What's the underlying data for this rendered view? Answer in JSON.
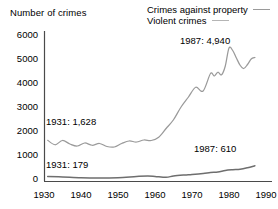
{
  "chart_data": {
    "type": "line",
    "title": "",
    "ylabel": "Number of crimes",
    "xlabel": "",
    "xlim": [
      1930,
      1990
    ],
    "ylim": [
      0,
      6000
    ],
    "grid": false,
    "legend_position": "top-right",
    "yticks": [
      "6000",
      "5000",
      "4000",
      "3000",
      "2000",
      "1000",
      "0"
    ],
    "ytick_values": [
      6000,
      5000,
      4000,
      3000,
      2000,
      1000,
      0
    ],
    "xticks": [
      "1930",
      "1940",
      "1950",
      "1960",
      "1970",
      "1980",
      "1990"
    ],
    "xtick_values": [
      1930,
      1940,
      1950,
      1960,
      1970,
      1980,
      1990
    ],
    "series": [
      {
        "name": "Crimes against property",
        "color": "#9a9a9a",
        "x": [
          1931,
          1933,
          1935,
          1937,
          1939,
          1941,
          1943,
          1945,
          1947,
          1949,
          1951,
          1953,
          1955,
          1957,
          1959,
          1961,
          1963,
          1965,
          1967,
          1969,
          1971,
          1973,
          1975,
          1976,
          1977,
          1978,
          1979,
          1980,
          1981,
          1982,
          1983,
          1984,
          1985,
          1986,
          1987
        ],
        "values": [
          1628,
          1450,
          1620,
          1480,
          1400,
          1520,
          1430,
          1500,
          1380,
          1360,
          1500,
          1600,
          1560,
          1640,
          1620,
          1750,
          2100,
          2450,
          2950,
          3350,
          3750,
          3600,
          4300,
          4200,
          4350,
          4250,
          4600,
          5320,
          5220,
          4920,
          4630,
          4500,
          4660,
          4880,
          4940
        ]
      },
      {
        "name": "Violent crimes",
        "color": "#6e6e6e",
        "x": [
          1931,
          1935,
          1940,
          1945,
          1950,
          1955,
          1958,
          1960,
          1963,
          1965,
          1968,
          1970,
          1973,
          1975,
          1977,
          1979,
          1981,
          1983,
          1985,
          1987
        ],
        "values": [
          179,
          160,
          130,
          120,
          135,
          180,
          200,
          185,
          150,
          200,
          240,
          260,
          300,
          340,
          360,
          420,
          450,
          470,
          530,
          610
        ]
      }
    ],
    "annotations": [
      {
        "text": "1931: 1,628",
        "x": 1931,
        "y": 1628,
        "label_x_px": 46,
        "label_y_px": 117
      },
      {
        "text": "1931: 179",
        "x": 1931,
        "y": 179,
        "label_x_px": 46,
        "label_y_px": 160
      },
      {
        "text": "1987: 4,940",
        "x": 1987,
        "y": 4940,
        "label_x_px": 180,
        "label_y_px": 36
      },
      {
        "text": "1987: 610",
        "x": 1987,
        "y": 610,
        "label_x_px": 194,
        "label_y_px": 144
      }
    ]
  },
  "axes": {
    "y_label": "Number of crimes",
    "y_ticks": [
      {
        "label": "6000",
        "top": 30
      },
      {
        "label": "5000",
        "top": 54
      },
      {
        "label": "4000",
        "top": 78
      },
      {
        "label": "3000",
        "top": 102
      },
      {
        "label": "2000",
        "top": 126
      },
      {
        "label": "1000",
        "top": 150
      },
      {
        "label": "0",
        "top": 174
      }
    ],
    "x_ticks": [
      {
        "label": "1930",
        "left": 27
      },
      {
        "label": "1940",
        "left": 64
      },
      {
        "label": "1950",
        "left": 101
      },
      {
        "label": "1960",
        "left": 138
      },
      {
        "label": "1970",
        "left": 175
      },
      {
        "label": "1980",
        "left": 212
      },
      {
        "label": "1990",
        "left": 249
      }
    ]
  },
  "legend": {
    "items": [
      {
        "label": "Crimes against property",
        "swatch": "property"
      },
      {
        "label": "Violent crimes",
        "swatch": "violent"
      }
    ]
  },
  "annotations": {
    "property_start": "1931: 1,628",
    "violent_start": "1931: 179",
    "property_end": "1987: 4,940",
    "violent_end": "1987: 610"
  }
}
